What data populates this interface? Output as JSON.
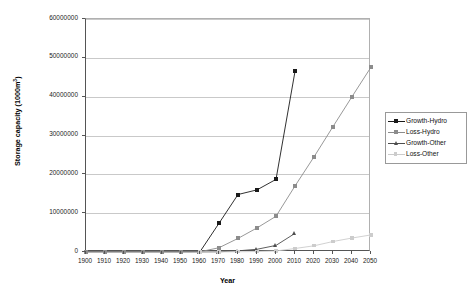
{
  "chart_data": {
    "type": "line",
    "title": "",
    "xlabel": "Year",
    "ylabel": "Storage capacity (1000m3)",
    "ylabel_prefix": "Storage capacity (1000m",
    "ylabel_superscript": "3",
    "ylabel_suffix": ")",
    "x": [
      1900,
      1910,
      1920,
      1930,
      1940,
      1950,
      1960,
      1970,
      1980,
      1990,
      2000,
      2010,
      2020,
      2030,
      2040,
      2050
    ],
    "xtick_labels": [
      "1900",
      "1910",
      "1920",
      "1930",
      "1940",
      "1950",
      "1960",
      "1970",
      "1980",
      "1990",
      "2000",
      "2010",
      "2020",
      "2030",
      "2040",
      "2050"
    ],
    "ytick_labels": [
      "60000000",
      "50000000",
      "40000000",
      "30000000",
      "20000000",
      "10000000",
      "0"
    ],
    "ytick_values": [
      60000000,
      50000000,
      40000000,
      30000000,
      20000000,
      10000000,
      0
    ],
    "xlim": [
      1900,
      2050
    ],
    "ylim": [
      0,
      60000000
    ],
    "grid": "horizontal",
    "legend_position": "right",
    "series": [
      {
        "name": "Growth-Hydro",
        "color": "#1a1a1a",
        "marker": "square",
        "x": [
          1900,
          1910,
          1920,
          1930,
          1940,
          1950,
          1960,
          1970,
          1980,
          1990,
          2000,
          2010
        ],
        "values": [
          60000,
          60000,
          60000,
          60000,
          60000,
          60000,
          70000,
          7400000,
          14800000,
          16000000,
          18700000,
          46500000
        ]
      },
      {
        "name": "Loss-Hydro",
        "color": "#8c8c8c",
        "marker": "square",
        "x": [
          1900,
          1910,
          1920,
          1930,
          1940,
          1950,
          1960,
          1970,
          1980,
          1990,
          2000,
          2010,
          2020,
          2030,
          2040,
          2050
        ],
        "values": [
          40000,
          40000,
          40000,
          40000,
          40000,
          40000,
          60000,
          1100000,
          3500000,
          6200000,
          9200000,
          17000000,
          24500000,
          32300000,
          40000000,
          47600000
        ]
      },
      {
        "name": "Growth-Other",
        "color": "#4d4d4d",
        "marker": "triangle",
        "x": [
          1960,
          1970,
          1980,
          1990,
          2000,
          2010
        ],
        "values": [
          20000,
          60000,
          300000,
          700000,
          1700000,
          4800000
        ]
      },
      {
        "name": "Loss-Other",
        "color": "#cccccc",
        "marker": "square",
        "x": [
          1960,
          1970,
          1980,
          1990,
          2000,
          2010,
          2020,
          2030,
          2040,
          2050
        ],
        "values": [
          10000,
          20000,
          60000,
          120000,
          260000,
          900000,
          1600000,
          2700000,
          3600000,
          4400000
        ]
      }
    ]
  }
}
